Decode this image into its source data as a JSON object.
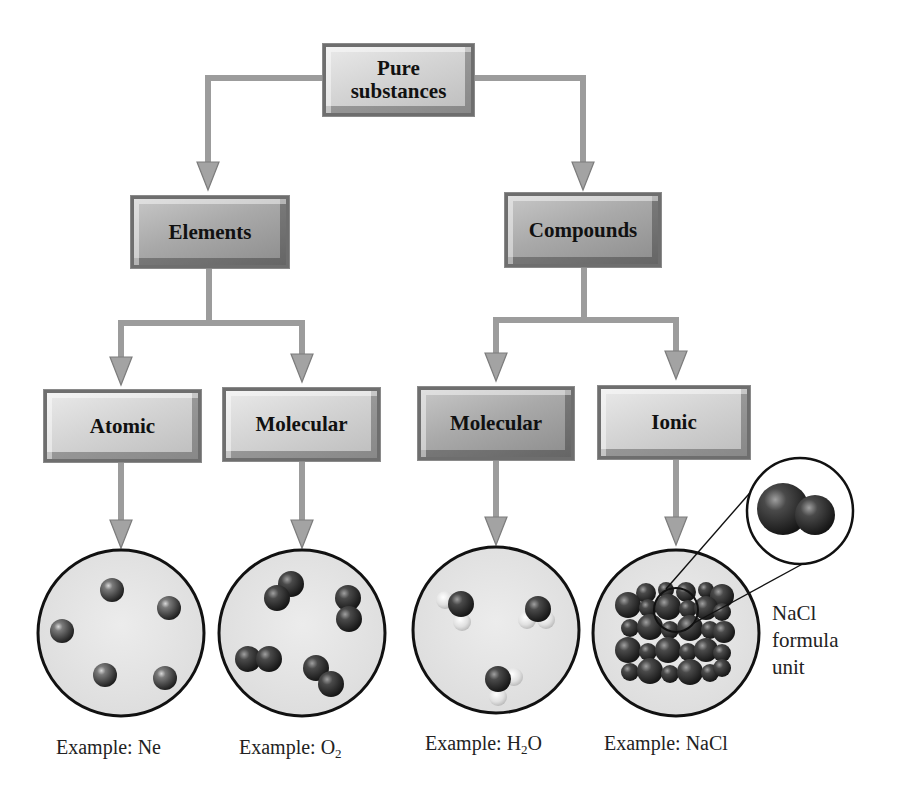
{
  "diagram": {
    "root": {
      "label_line1": "Pure",
      "label_line2": "substances"
    },
    "level1": [
      {
        "label": "Elements"
      },
      {
        "label": "Compounds"
      }
    ],
    "level2": [
      {
        "label": "Atomic",
        "parent": "Elements"
      },
      {
        "label": "Molecular",
        "parent": "Elements"
      },
      {
        "label": "Molecular",
        "parent": "Compounds"
      },
      {
        "label": "Ionic",
        "parent": "Compounds"
      }
    ],
    "examples": [
      {
        "prefix": "Example: ",
        "formula_main": "Ne",
        "subscript": "",
        "formula_tail": "",
        "illustration": "five separate neon atoms"
      },
      {
        "prefix": "Example: ",
        "formula_main": "O",
        "subscript": "2",
        "formula_tail": "",
        "illustration": "four diatomic oxygen molecules"
      },
      {
        "prefix": "Example: ",
        "formula_main": "H",
        "subscript": "2",
        "formula_tail": "O",
        "illustration": "three water molecules"
      },
      {
        "prefix": "Example: ",
        "formula_main": "NaCl",
        "subscript": "",
        "formula_tail": "",
        "illustration": "sodium chloride crystal lattice"
      }
    ],
    "callout": {
      "line1": "NaCl",
      "line2": "formula",
      "line3": "unit"
    },
    "colors": {
      "arrow": "#9a9a9a",
      "arrow_edge": "#7a7a7a",
      "box_light": "#d4d4d4",
      "box_dark": "#a9a9a9",
      "circle_fill": "#e3e3e3",
      "circle_stroke": "#111111",
      "atom": "#5a5a5a"
    }
  }
}
